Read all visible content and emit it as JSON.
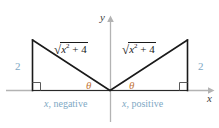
{
  "figure": {
    "axes": {
      "x_label": "x",
      "y_label": "y",
      "x_axis_color": "#b3b3b3",
      "y_axis_color": "#b3b3b3"
    },
    "colors": {
      "triangle_stroke": "#1a1a1a",
      "leg_label": "#7ea8c4",
      "sign_label": "#7ea8c4",
      "theta": "#c4773a",
      "axis": "#b3b3b3",
      "background": "#ffffff"
    },
    "left_triangle": {
      "hypotenuse_label": {
        "radical": "√",
        "base": "x",
        "exponent": "2",
        "rest": "+ 4",
        "plain": "√(x² + 4)"
      },
      "vertical_leg_label": "2",
      "angle_label": "θ",
      "caption_variable": "x",
      "caption_text": ", negative",
      "right_angle_marker": true
    },
    "right_triangle": {
      "hypotenuse_label": {
        "radical": "√",
        "base": "x",
        "exponent": "2",
        "rest": "+ 4",
        "plain": "√(x² + 4)"
      },
      "vertical_leg_label": "2",
      "angle_label": "θ",
      "caption_variable": "x",
      "caption_text": ", positive",
      "right_angle_marker": true
    }
  }
}
